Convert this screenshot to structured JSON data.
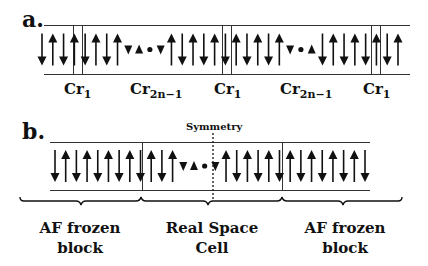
{
  "panel_a": {
    "label": "a.",
    "sites_labels": [
      {
        "base": "Cr",
        "sub": "1"
      },
      {
        "base": "Cr",
        "sub": "2n−1"
      },
      {
        "base": "Cr",
        "sub": "1"
      },
      {
        "base": "Cr",
        "sub": "2n−1"
      },
      {
        "base": "Cr",
        "sub": "1"
      }
    ],
    "spin_sequence": [
      "down",
      "up",
      "down",
      "up",
      "down",
      "up",
      "down",
      "up",
      "down-small",
      "up-small",
      "node",
      "down-small",
      "up",
      "down",
      "up",
      "down",
      "up",
      "down",
      "up",
      "down",
      "up",
      "down",
      "up",
      "down-small",
      "node",
      "up-small",
      "down",
      "up",
      "down",
      "up",
      "down",
      "up",
      "down",
      "up"
    ]
  },
  "panel_b": {
    "label": "b.",
    "symmetry_label": "Symmetry",
    "regions": [
      {
        "line1": "AF frozen",
        "line2": "block"
      },
      {
        "line1": "Real Space",
        "line2": "Cell"
      },
      {
        "line1": "AF frozen",
        "line2": "block"
      }
    ],
    "spin_sequence": [
      "down",
      "up",
      "down",
      "up",
      "down",
      "up",
      "down",
      "up",
      "down",
      "up",
      "down",
      "up",
      "down-small",
      "up-small",
      "node",
      "down-small",
      "up",
      "down",
      "up",
      "down",
      "up",
      "down",
      "up",
      "down",
      "up",
      "down",
      "up",
      "down",
      "up",
      "down"
    ]
  }
}
